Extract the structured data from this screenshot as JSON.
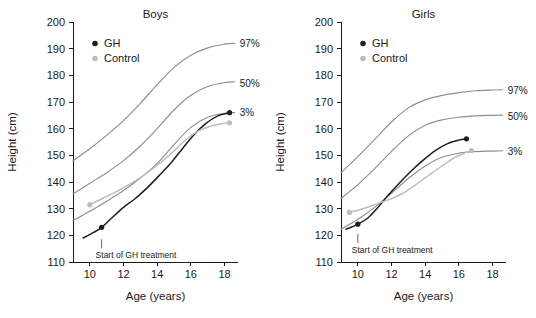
{
  "figure": {
    "background": "#ffffff",
    "width": 536,
    "height": 318
  },
  "colors": {
    "gh": "#1f1f1f",
    "control": "#bdbdbd",
    "reference": "#8e8e8e",
    "axis": "#1a1a1a"
  },
  "axis": {
    "xlabel": "Age (years)",
    "ylabel": "Height (cm)",
    "xticks": [
      "10",
      "12",
      "14",
      "16",
      "18"
    ],
    "yticks": [
      "110",
      "120",
      "130",
      "140",
      "150",
      "160",
      "170",
      "180",
      "190",
      "200"
    ]
  },
  "annotation": {
    "text": "Start of GH treatment"
  },
  "legend": {
    "gh": "GH",
    "control": "Control"
  },
  "percentiles": {
    "p97": "97%",
    "p50": "50%",
    "p3": "3%"
  },
  "chart_data": [
    {
      "type": "line",
      "title": "Boys",
      "xlabel": "Age (years)",
      "ylabel": "Height (cm)",
      "xlim": [
        9,
        18.8
      ],
      "ylim": [
        110,
        200
      ],
      "xticks": [
        10,
        12,
        14,
        16,
        18
      ],
      "yticks": [
        110,
        120,
        130,
        140,
        150,
        160,
        170,
        180,
        190,
        200
      ],
      "grid": false,
      "legend_position": "top-left",
      "annotations": [
        {
          "text": "Start of GH treatment",
          "x": 10.7,
          "y": 118.5
        },
        {
          "text": "97%",
          "x": 18.9,
          "y": 192
        },
        {
          "text": "50%",
          "x": 18.9,
          "y": 177
        },
        {
          "text": "3%",
          "x": 18.9,
          "y": 166
        }
      ],
      "series": [
        {
          "name": "97%",
          "kind": "reference",
          "x": [
            9.0,
            10,
            11,
            12,
            13,
            14,
            15,
            16,
            17,
            18,
            18.6
          ],
          "y": [
            148.0,
            152.5,
            157.5,
            163.0,
            169.5,
            176.5,
            183.0,
            187.5,
            190.3,
            191.7,
            192.0
          ]
        },
        {
          "name": "50%",
          "kind": "reference",
          "x": [
            9.0,
            10,
            11,
            12,
            13,
            14,
            15,
            16,
            17,
            18,
            18.6
          ],
          "y": [
            135.5,
            139.5,
            143.5,
            148.0,
            153.5,
            160.0,
            167.0,
            172.5,
            175.8,
            177.3,
            177.6
          ]
        },
        {
          "name": "3%",
          "kind": "reference",
          "x": [
            9.0,
            10,
            11,
            12,
            13,
            14,
            15,
            16,
            17,
            18,
            18.6
          ],
          "y": [
            125.5,
            129.0,
            132.8,
            136.8,
            141.5,
            147.0,
            154.0,
            160.5,
            164.3,
            165.8,
            166.0
          ]
        },
        {
          "name": "GH",
          "kind": "gh",
          "x": [
            9.6,
            10.2,
            10.7,
            11.3,
            12.0,
            12.7,
            13.4,
            14.1,
            14.8,
            15.5,
            16.2,
            16.9,
            17.6,
            18.3
          ],
          "y": [
            119.0,
            121.0,
            123.0,
            126.5,
            130.5,
            133.8,
            137.8,
            142.3,
            147.0,
            152.5,
            157.8,
            162.0,
            164.8,
            166.0
          ],
          "markers": [
            {
              "x": 10.7,
              "y": 123.0
            },
            {
              "x": 18.3,
              "y": 166.0
            }
          ]
        },
        {
          "name": "Control",
          "kind": "control",
          "x": [
            10.0,
            10.8,
            11.6,
            12.4,
            13.2,
            14.0,
            14.8,
            15.6,
            16.4,
            17.2,
            18.0,
            18.3
          ],
          "y": [
            131.5,
            134.0,
            136.5,
            139.3,
            142.5,
            146.3,
            150.5,
            155.3,
            159.0,
            161.0,
            162.0,
            162.2
          ],
          "markers": [
            {
              "x": 10.0,
              "y": 131.5
            },
            {
              "x": 18.3,
              "y": 162.2
            }
          ]
        }
      ]
    },
    {
      "type": "line",
      "title": "Girls",
      "xlabel": "Age (years)",
      "ylabel": "Height (cm)",
      "xlim": [
        9,
        18.8
      ],
      "ylim": [
        110,
        200
      ],
      "xticks": [
        10,
        12,
        14,
        16,
        18
      ],
      "yticks": [
        110,
        120,
        130,
        140,
        150,
        160,
        170,
        180,
        190,
        200
      ],
      "grid": false,
      "legend_position": "top-left",
      "annotations": [
        {
          "text": "Start of GH treatment",
          "x": 10.0,
          "y": 120.5
        },
        {
          "text": "97%",
          "x": 18.9,
          "y": 174.5
        },
        {
          "text": "50%",
          "x": 18.9,
          "y": 164.5
        },
        {
          "text": "3%",
          "x": 18.9,
          "y": 151.5
        }
      ],
      "series": [
        {
          "name": "97%",
          "kind": "reference",
          "x": [
            9.0,
            10,
            11,
            12,
            13,
            14,
            15,
            16,
            17,
            18,
            18.6
          ],
          "y": [
            143.5,
            149.5,
            156.0,
            162.5,
            167.8,
            170.8,
            172.5,
            173.5,
            174.2,
            174.5,
            174.6
          ]
        },
        {
          "name": "50%",
          "kind": "reference",
          "x": [
            9.0,
            10,
            11,
            12,
            13,
            14,
            15,
            16,
            17,
            18,
            18.6
          ],
          "y": [
            133.8,
            139.0,
            145.0,
            151.5,
            157.3,
            161.3,
            163.3,
            164.3,
            164.8,
            165.0,
            165.1
          ]
        },
        {
          "name": "3%",
          "kind": "reference",
          "x": [
            9.0,
            10,
            11,
            12,
            13,
            14,
            15,
            16,
            17,
            18,
            18.6
          ],
          "y": [
            122.3,
            126.0,
            130.5,
            135.8,
            141.3,
            146.0,
            149.3,
            150.8,
            151.4,
            151.6,
            151.7
          ]
        },
        {
          "name": "GH",
          "kind": "gh",
          "x": [
            9.3,
            9.7,
            10.0,
            10.6,
            11.2,
            11.8,
            12.5,
            13.2,
            13.9,
            14.6,
            15.3,
            16.0,
            16.45
          ],
          "y": [
            122.3,
            123.3,
            124.2,
            126.5,
            130.5,
            135.0,
            139.8,
            144.3,
            148.3,
            151.8,
            154.3,
            155.7,
            156.2
          ],
          "markers": [
            {
              "x": 10.0,
              "y": 124.2
            },
            {
              "x": 16.45,
              "y": 156.2
            }
          ]
        },
        {
          "name": "Control",
          "kind": "control",
          "x": [
            9.5,
            10.2,
            11.0,
            11.8,
            12.6,
            13.4,
            14.2,
            15.0,
            15.8,
            16.4,
            16.75
          ],
          "y": [
            128.6,
            129.8,
            131.5,
            133.3,
            135.5,
            138.8,
            142.5,
            146.0,
            149.3,
            151.0,
            151.8
          ],
          "markers": [
            {
              "x": 9.5,
              "y": 128.6
            },
            {
              "x": 16.75,
              "y": 151.8
            }
          ]
        }
      ]
    }
  ]
}
